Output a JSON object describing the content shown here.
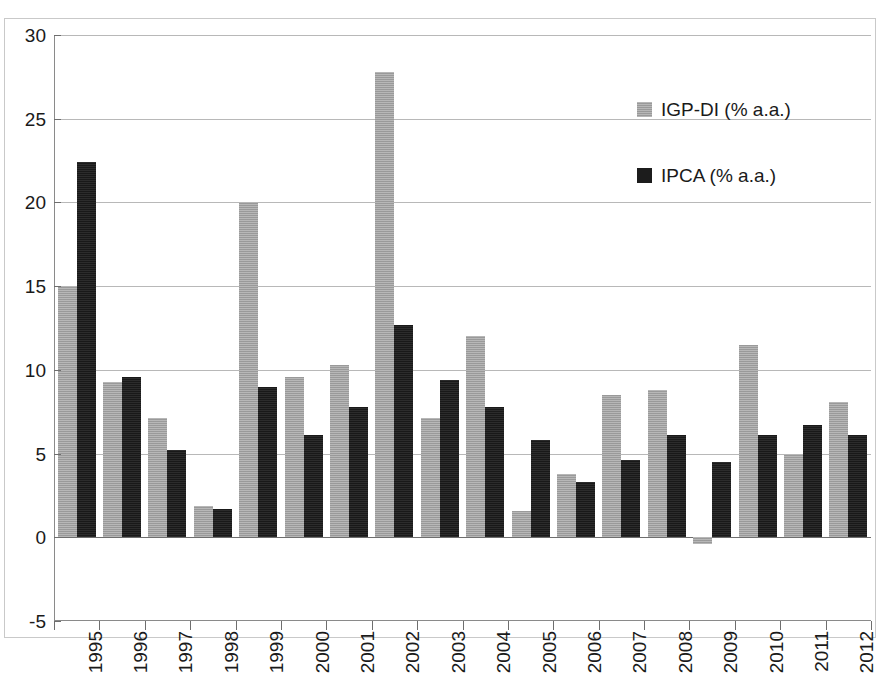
{
  "chart_data": {
    "type": "bar",
    "title": "",
    "subtitle": "",
    "xlabel": "",
    "ylabel": "",
    "ylim": [
      -5,
      30
    ],
    "ytick_step": 5,
    "yticks": [
      "30",
      "25",
      "20",
      "15",
      "10",
      "5",
      "0",
      "-5"
    ],
    "grid": true,
    "legend_position": "top-right",
    "categories": [
      "1995",
      "1996",
      "1997",
      "1998",
      "1999",
      "2000",
      "2001",
      "2002",
      "2003",
      "2004",
      "2005",
      "2006",
      "2007",
      "2008",
      "2009",
      "2010",
      "2011",
      "2012"
    ],
    "series": [
      {
        "name": "IGP-DI (% a.a.)",
        "color": "#a3a3a3",
        "values": [
          15.0,
          9.3,
          7.1,
          1.9,
          20.0,
          9.6,
          10.3,
          27.8,
          7.1,
          12.0,
          1.6,
          3.8,
          8.5,
          8.8,
          -0.4,
          11.5,
          4.9,
          8.1
        ]
      },
      {
        "name": "IPCA (% a.a.)",
        "color": "#1c1c1c",
        "values": [
          22.4,
          9.6,
          5.2,
          1.7,
          9.0,
          6.1,
          7.8,
          12.7,
          9.4,
          7.8,
          5.8,
          3.3,
          4.6,
          6.1,
          4.5,
          6.1,
          6.7,
          6.1
        ]
      }
    ]
  },
  "legend": {
    "items": [
      {
        "label": "IGP-DI (% a.a.)",
        "swatch": "igp"
      },
      {
        "label": "IPCA (% a.a.)",
        "swatch": "ipca"
      }
    ]
  },
  "colors": {
    "series_igp": "#a3a3a3",
    "series_ipca": "#1c1c1c",
    "gridline": "#b8b8b8",
    "axis": "#6e6e6e",
    "frame": "#c9c9c9",
    "text": "#1a1a1a",
    "background": "#ffffff"
  }
}
